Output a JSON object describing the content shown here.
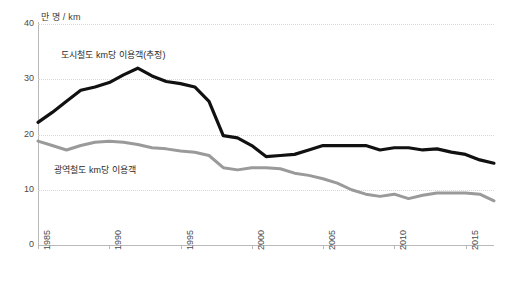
{
  "chart_data": {
    "type": "line",
    "title": "",
    "xlabel": "",
    "ylabel": "만 명 / km",
    "unit_caption": "만 명 / km",
    "grid": true,
    "legend_position": "inline-annotation",
    "xlim": [
      1985,
      2017
    ],
    "ylim": [
      0,
      40
    ],
    "y_ticks": [
      0,
      10,
      20,
      30,
      40
    ],
    "x_ticks": [
      1985,
      1990,
      1995,
      2000,
      2005,
      2010,
      2015
    ],
    "x": [
      1985,
      1986,
      1987,
      1988,
      1989,
      1990,
      1991,
      1992,
      1993,
      1994,
      1995,
      1996,
      1997,
      1998,
      1999,
      2000,
      2001,
      2002,
      2003,
      2004,
      2005,
      2006,
      2007,
      2008,
      2009,
      2010,
      2011,
      2012,
      2013,
      2014,
      2015,
      2016,
      2017
    ],
    "series": [
      {
        "name": "도시철도 km당 이용객(추정)",
        "color": "#111111",
        "values": [
          22.2,
          24.0,
          26.0,
          28.0,
          28.6,
          29.4,
          30.8,
          32.0,
          30.6,
          29.6,
          29.2,
          28.6,
          26.0,
          19.8,
          19.4,
          18.0,
          16.0,
          16.2,
          16.4,
          17.2,
          18.0,
          18.0,
          18.0,
          18.0,
          17.2,
          17.6,
          17.6,
          17.2,
          17.4,
          16.8,
          16.4,
          15.4,
          14.8
        ]
      },
      {
        "name": "광역철도 km당 이용객",
        "color": "#9a9a9a",
        "values": [
          18.8,
          18.0,
          17.2,
          18.0,
          18.6,
          18.8,
          18.6,
          18.2,
          17.6,
          17.4,
          17.0,
          16.8,
          16.2,
          14.0,
          13.6,
          14.0,
          14.0,
          13.8,
          13.0,
          12.6,
          12.0,
          11.2,
          10.0,
          9.2,
          8.8,
          9.2,
          8.4,
          9.0,
          9.4,
          9.4,
          9.4,
          9.2,
          8.0
        ]
      }
    ]
  },
  "axis": {
    "unit": "만 명 / km"
  },
  "annotations": {
    "urban": "도시철도 km당 이용객(추정)",
    "metro": "광역철도 km당 이용객"
  }
}
